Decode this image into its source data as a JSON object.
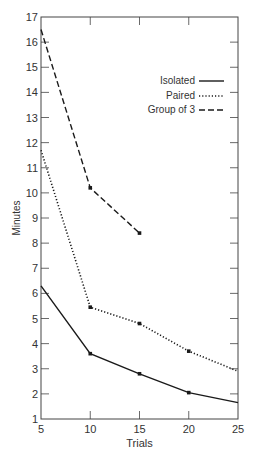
{
  "chart_data": {
    "type": "line",
    "title": "",
    "xlabel": "Trials",
    "ylabel": "Minutes",
    "x": [
      5,
      10,
      15,
      20,
      25
    ],
    "xlim": [
      5,
      25
    ],
    "ylim": [
      1,
      17
    ],
    "x_ticks": [
      5,
      10,
      15,
      20,
      25
    ],
    "y_ticks": [
      1,
      2,
      3,
      4,
      5,
      6,
      7,
      8,
      9,
      10,
      11,
      12,
      13,
      14,
      15,
      16,
      17
    ],
    "grid": false,
    "legend_position": "upper right",
    "series": [
      {
        "name": "Isolated",
        "style": "solid",
        "x": [
          5,
          10,
          15,
          20,
          25
        ],
        "values": [
          6.3,
          3.6,
          2.8,
          2.05,
          1.65
        ]
      },
      {
        "name": "Paired",
        "style": "dotted",
        "x": [
          5,
          10,
          15,
          20,
          25
        ],
        "values": [
          11.7,
          5.45,
          4.8,
          3.7,
          2.9
        ]
      },
      {
        "name": "Group of 3",
        "style": "dashed",
        "x": [
          5,
          10,
          15
        ],
        "values": [
          16.5,
          10.2,
          8.4
        ]
      }
    ]
  },
  "colors": {
    "line": "#1a1a1a",
    "axis": "#444444",
    "text": "#333333"
  }
}
